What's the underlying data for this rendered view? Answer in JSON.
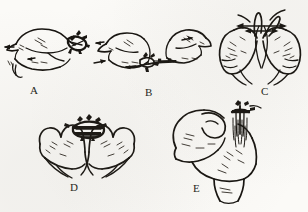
{
  "figure": {
    "type": "line-drawing-figure",
    "background_color": "#fbfaf7",
    "ink_color": "#16130f",
    "panel_count": 5
  },
  "panels": [
    {
      "id": "A",
      "label": "A",
      "caption": "",
      "content": "Two hands shown from the side, fists nearly meeting, fingertips working a small dark knotted bundle at the right; small directional tick marks beside the knuckles.",
      "has_arrows": true,
      "arrow_count": 3,
      "arrow_type": "single-headed"
    },
    {
      "id": "B",
      "label": "B",
      "caption": "",
      "content": "Two hands drawn apart, pulling a thin strand taut horizontally between them; the strand carries two small dark beads or knots near the centre.",
      "has_arrows": true,
      "arrow_count": 3,
      "arrow_type": "single-headed"
    },
    {
      "id": "C",
      "label": "C",
      "caption": "",
      "content": "Both hands seen from behind, thumbs and index fingers raised and touching at the top, a loop held between them; a horizontal double-headed arrow crosses the loop and two angled strands rise above the fingers.",
      "has_arrows": true,
      "arrow_count": 2,
      "arrow_type": "double-headed"
    },
    {
      "id": "D",
      "label": "D",
      "caption": "",
      "content": "Both hands viewed from the back, fingers curled downward and index fingers meeting in the middle beneath a dark compact knot resting on top.",
      "has_arrows": false,
      "arrow_count": 0,
      "arrow_type": ""
    },
    {
      "id": "E",
      "label": "E",
      "caption": "",
      "content": "Close-up of one hand gripped over the other in a three-quarter view, a bundle of fine strands gathered vertically at the right between the fingers, secured at the top.",
      "has_arrows": false,
      "arrow_count": 0,
      "arrow_type": ""
    }
  ],
  "labels": {
    "a": "A",
    "b": "B",
    "c": "C",
    "d": "D",
    "e": "E"
  }
}
